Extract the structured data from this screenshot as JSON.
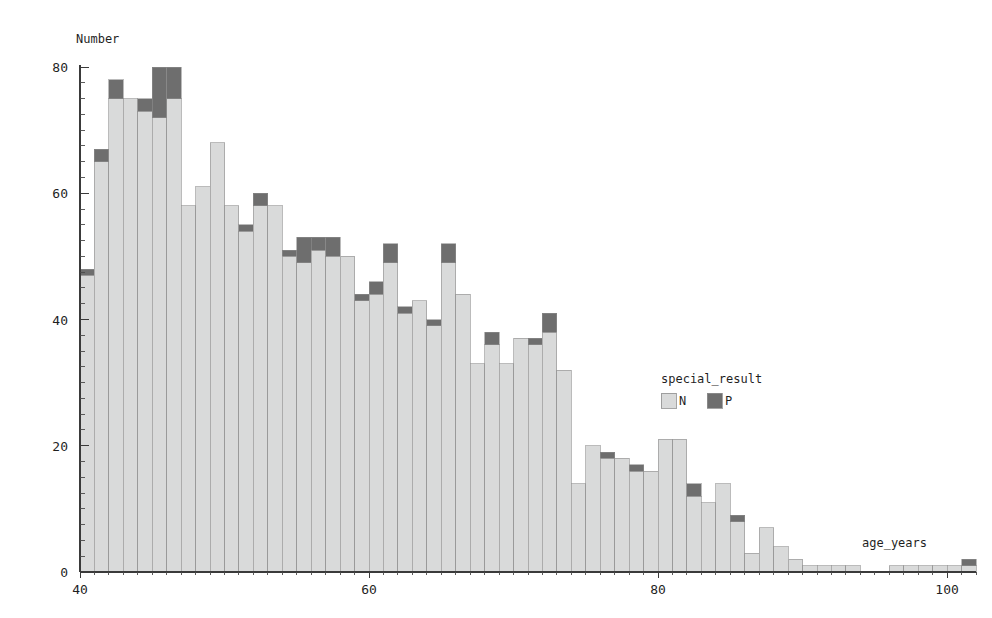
{
  "chart_data": {
    "type": "bar",
    "subtype": "stacked-histogram",
    "title": "",
    "xlabel": "age_years",
    "ylabel": "Number",
    "xlim": [
      40,
      102
    ],
    "ylim": [
      0,
      80
    ],
    "bin_width": 1,
    "grid": false,
    "legend": {
      "title": "special_result",
      "position": "inside-right",
      "entries": [
        {
          "name": "N",
          "color": "#d9dada"
        },
        {
          "name": "P",
          "color": "#6e6e6e"
        }
      ]
    },
    "xticks": [
      40,
      60,
      80,
      100
    ],
    "xticklabels": [
      "40",
      "60",
      "80",
      "100"
    ],
    "yticks": [
      0,
      20,
      40,
      60,
      80
    ],
    "yticklabels": [
      "0",
      "20",
      "40",
      "60",
      "80"
    ],
    "x_minor_step": 1,
    "y_minor_step": 2.5,
    "categories": [
      40,
      41,
      42,
      43,
      44,
      45,
      46,
      47,
      48,
      49,
      50,
      51,
      52,
      53,
      54,
      55,
      56,
      57,
      58,
      59,
      60,
      61,
      62,
      63,
      64,
      65,
      66,
      67,
      68,
      69,
      70,
      71,
      72,
      73,
      74,
      75,
      76,
      77,
      78,
      79,
      80,
      81,
      82,
      83,
      84,
      85,
      86,
      87,
      88,
      89,
      90,
      91,
      92,
      93,
      94,
      95,
      96,
      97,
      98,
      99,
      100,
      101
    ],
    "series": [
      {
        "name": "N",
        "color": "#d9dada",
        "values": [
          47,
          65,
          75,
          75,
          73,
          72,
          75,
          58,
          61,
          68,
          58,
          54,
          58,
          58,
          50,
          49,
          51,
          50,
          50,
          43,
          44,
          49,
          41,
          43,
          39,
          49,
          44,
          33,
          36,
          33,
          37,
          36,
          38,
          32,
          14,
          20,
          18,
          18,
          16,
          16,
          21,
          21,
          12,
          11,
          14,
          8,
          3,
          7,
          4,
          2,
          1,
          1,
          1,
          1,
          0,
          0,
          1,
          1,
          1,
          1,
          1,
          1
        ]
      },
      {
        "name": "P",
        "color": "#6e6e6e",
        "values": [
          1,
          2,
          3,
          0,
          2,
          8,
          5,
          0,
          0,
          0,
          0,
          1,
          2,
          0,
          1,
          4,
          2,
          3,
          0,
          1,
          2,
          3,
          1,
          0,
          1,
          3,
          0,
          0,
          2,
          0,
          0,
          1,
          3,
          0,
          0,
          0,
          1,
          0,
          1,
          0,
          0,
          0,
          2,
          0,
          0,
          1,
          0,
          0,
          0,
          0,
          0,
          0,
          0,
          0,
          0,
          0,
          0,
          0,
          0,
          0,
          0,
          1
        ]
      }
    ],
    "totals": [
      48,
      67,
      78,
      75,
      75,
      80,
      80,
      58,
      61,
      68,
      58,
      55,
      60,
      58,
      51,
      53,
      53,
      53,
      50,
      44,
      46,
      52,
      42,
      43,
      40,
      52,
      44,
      33,
      38,
      33,
      37,
      37,
      41,
      32,
      14,
      20,
      19,
      18,
      17,
      16,
      21,
      21,
      14,
      11,
      14,
      9,
      3,
      7,
      4,
      2,
      1,
      1,
      1,
      1,
      0,
      0,
      1,
      1,
      1,
      1,
      1,
      2
    ]
  },
  "axes": {
    "y_axis_title": "Number",
    "x_axis_title": "age_years"
  },
  "legend": {
    "title": "special_result",
    "item_n": "N",
    "item_p": "P"
  },
  "colors": {
    "series_n": "#d9dada",
    "series_p": "#6e6e6e",
    "axis": "#3a3a3a",
    "text": "#1f1f1f",
    "background": "#ffffff"
  }
}
